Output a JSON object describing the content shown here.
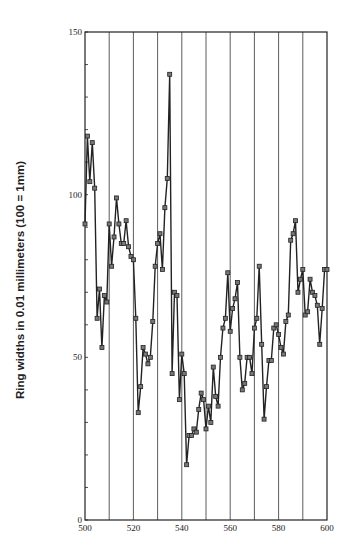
{
  "chart_data": {
    "type": "line",
    "title": "",
    "xlabel": "",
    "ylabel": "Ring widths in 0.01 millimeters (100 = 1mm)",
    "xlim": [
      500,
      600
    ],
    "ylim": [
      0,
      150
    ],
    "x_ticks": [
      500,
      520,
      540,
      560,
      580,
      600
    ],
    "y_ticks": [
      0,
      50,
      100,
      150
    ],
    "vertical_gridlines": [
      510,
      520,
      530,
      540,
      550,
      560,
      570,
      580,
      590
    ],
    "marker": "square",
    "x": [
      500,
      501,
      502,
      503,
      504,
      505,
      506,
      507,
      508,
      509,
      510,
      511,
      512,
      513,
      514,
      515,
      516,
      517,
      518,
      519,
      520,
      521,
      522,
      523,
      524,
      525,
      526,
      527,
      528,
      529,
      530,
      531,
      532,
      533,
      534,
      535,
      536,
      537,
      538,
      539,
      540,
      541,
      542,
      543,
      544,
      545,
      546,
      547,
      548,
      549,
      550,
      551,
      552,
      553,
      554,
      555,
      556,
      557,
      558,
      559,
      560,
      561,
      562,
      563,
      564,
      565,
      566,
      567,
      568,
      569,
      570,
      571,
      572,
      573,
      574,
      575,
      576,
      577,
      578,
      579,
      580,
      581,
      582,
      583,
      584,
      585,
      586,
      587,
      588,
      589,
      590,
      591,
      592,
      593,
      594,
      595,
      596,
      597,
      598,
      599,
      600
    ],
    "values": [
      91,
      118,
      104,
      116,
      102,
      62,
      71,
      53,
      69,
      67,
      91,
      78,
      87,
      99,
      91,
      85,
      85,
      92,
      84,
      81,
      80,
      62,
      33,
      41,
      53,
      51,
      48,
      50,
      61,
      78,
      85,
      88,
      77,
      96,
      105,
      137,
      45,
      70,
      69,
      37,
      51,
      45,
      17,
      26,
      26,
      28,
      27,
      34,
      39,
      37,
      28,
      35,
      30,
      47,
      38,
      35,
      50,
      59,
      62,
      76,
      58,
      65,
      68,
      73,
      50,
      40,
      42,
      50,
      50,
      45,
      59,
      62,
      78,
      54,
      31,
      41,
      49,
      49,
      59,
      60,
      57,
      53,
      51,
      61,
      63,
      86,
      88,
      92,
      70,
      74,
      77,
      63,
      64,
      74,
      70,
      69,
      66,
      54,
      65,
      77,
      77
    ]
  },
  "axes": {
    "ylabel": "Ring widths in 0.01 millimeters (100 = 1mm)",
    "x_tick_labels": [
      "500",
      "520",
      "540",
      "560",
      "580",
      "600"
    ],
    "y_tick_labels": [
      "0",
      "50",
      "100",
      "150"
    ]
  }
}
